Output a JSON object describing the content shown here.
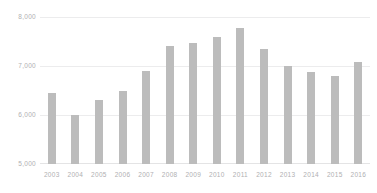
{
  "chart_data": {
    "type": "bar",
    "title": "",
    "subtitle": "",
    "xlabel": "",
    "ylabel": "",
    "categories": [
      "2003",
      "2004",
      "2005",
      "2006",
      "2007",
      "2008",
      "2009",
      "2010",
      "2011",
      "2012",
      "2013",
      "2014",
      "2015",
      "2016"
    ],
    "values": [
      6450,
      6000,
      6300,
      6500,
      6900,
      7400,
      7470,
      7600,
      7780,
      7350,
      7000,
      6870,
      6800,
      7080
    ],
    "series": [
      {
        "name": "",
        "values": [
          6450,
          6000,
          6300,
          6500,
          6900,
          7400,
          7470,
          7600,
          7780,
          7350,
          7000,
          6870,
          6800,
          7080
        ]
      }
    ],
    "ylim": [
      5000,
      8000
    ],
    "y_ticks": [
      5000,
      6000,
      7000,
      8000
    ],
    "y_tick_labels": [
      "5,000",
      "6,000",
      "7,000",
      "8,000"
    ],
    "x_tick_labels": [
      "2003",
      "2004",
      "2005",
      "2006",
      "2007",
      "2008",
      "2009",
      "2010",
      "2011",
      "2012",
      "2013",
      "2014",
      "2015",
      "2016"
    ],
    "grid": true,
    "grid_axis": "y",
    "legend": false,
    "legend_position": "none",
    "bar_color": "#bcbcbc",
    "gridline_color": "#ececed",
    "axis_label_color": "#b0b0b2",
    "background_color": "#ffffff"
  }
}
